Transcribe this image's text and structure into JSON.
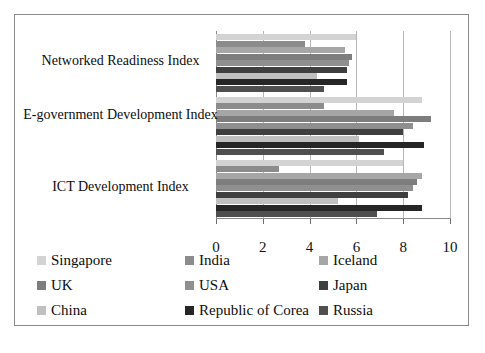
{
  "chart_data": {
    "type": "bar",
    "orientation": "horizontal",
    "title": "",
    "xlabel": "",
    "ylabel": "",
    "xlim": [
      0,
      10
    ],
    "xticks": [
      0,
      2,
      4,
      6,
      8,
      10
    ],
    "xtick_labels": [
      "0",
      "2",
      "4",
      "6",
      "8",
      "10"
    ],
    "grid": true,
    "legend_position": "bottom",
    "categories": [
      "Networked Readiness Index",
      "E-government Development Index",
      "ICT Development Index"
    ],
    "series": [
      {
        "name": "Singapore",
        "color": "#d3d3d3",
        "values": [
          6.0,
          8.8,
          8.0
        ]
      },
      {
        "name": "India",
        "color": "#8c8c8c",
        "values": [
          3.8,
          4.6,
          2.7
        ]
      },
      {
        "name": "Iceland",
        "color": "#a6a6a6",
        "values": [
          5.5,
          7.6,
          8.8
        ]
      },
      {
        "name": "UK",
        "color": "#7d7d7d",
        "values": [
          5.8,
          9.2,
          8.6
        ]
      },
      {
        "name": "USA",
        "color": "#8f8f8f",
        "values": [
          5.7,
          8.4,
          8.4
        ]
      },
      {
        "name": "Japan",
        "color": "#3f3f3f",
        "values": [
          5.6,
          8.0,
          8.2
        ]
      },
      {
        "name": "China",
        "color": "#c0c0c0",
        "values": [
          4.3,
          6.1,
          5.2
        ]
      },
      {
        "name": "Republic of Corea",
        "color": "#262626",
        "values": [
          5.6,
          8.9,
          8.8
        ]
      },
      {
        "name": "Russia",
        "color": "#4f4f4f",
        "values": [
          4.6,
          7.2,
          6.9
        ]
      }
    ]
  },
  "legend": {
    "items": [
      {
        "label": "Singapore",
        "color": "#d3d3d3"
      },
      {
        "label": "India",
        "color": "#8c8c8c"
      },
      {
        "label": "Iceland",
        "color": "#a6a6a6"
      },
      {
        "label": "UK",
        "color": "#7d7d7d"
      },
      {
        "label": "USA",
        "color": "#8f8f8f"
      },
      {
        "label": "Japan",
        "color": "#3f3f3f"
      },
      {
        "label": "China",
        "color": "#c0c0c0"
      },
      {
        "label": "Republic of Corea",
        "color": "#262626"
      },
      {
        "label": "Russia",
        "color": "#4f4f4f"
      }
    ]
  },
  "axis": {
    "tick_labels": [
      "0",
      "2",
      "4",
      "6",
      "8",
      "10"
    ]
  },
  "category_labels": [
    "Networked Readiness Index",
    "E-government Development",
    "Index",
    "ICT Development Index"
  ]
}
